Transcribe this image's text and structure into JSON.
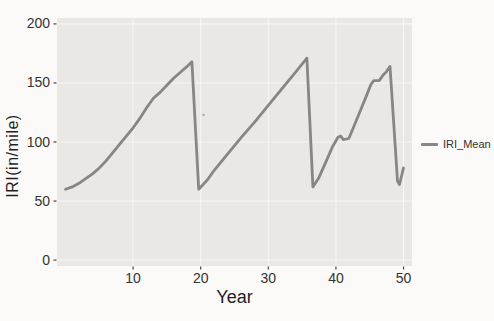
{
  "figure": {
    "kind": "photographed-statistical-plot",
    "background_color": "#fbfaf8",
    "panel_color": "#e9e8e4",
    "tick_text_color": "#333333",
    "axis_title_color": "#1f1f1f"
  },
  "chart_data": {
    "type": "line",
    "title": "",
    "xlabel": "Year",
    "ylabel": "IRI(in/mile)",
    "xlim": [
      0,
      50
    ],
    "ylim": [
      0,
      200
    ],
    "x_ticks": [
      10,
      20,
      30,
      40,
      50
    ],
    "y_ticks": [
      0,
      50,
      100,
      150,
      200
    ],
    "grid": "faint white major gridlines on light gray panel",
    "legend": {
      "position": "right",
      "entries": [
        {
          "label": "IRI_Mean",
          "color": "#868686"
        }
      ]
    },
    "series": [
      {
        "name": "IRI_Mean",
        "color": "#868686",
        "line_width": 2.8,
        "points": [
          [
            0,
            60
          ],
          [
            1,
            62
          ],
          [
            2,
            65
          ],
          [
            3,
            69
          ],
          [
            4,
            73
          ],
          [
            5,
            78
          ],
          [
            6,
            84
          ],
          [
            7,
            91
          ],
          [
            8,
            98
          ],
          [
            9,
            105
          ],
          [
            10,
            112
          ],
          [
            11,
            120
          ],
          [
            12,
            129
          ],
          [
            13,
            137
          ],
          [
            14,
            142
          ],
          [
            15,
            148
          ],
          [
            16,
            154
          ],
          [
            17,
            159
          ],
          [
            18,
            164
          ],
          [
            18.7,
            168
          ],
          [
            19.7,
            60
          ],
          [
            21,
            68
          ],
          [
            22,
            76
          ],
          [
            24,
            90
          ],
          [
            26,
            104
          ],
          [
            28,
            117
          ],
          [
            30,
            131
          ],
          [
            32,
            145
          ],
          [
            34,
            159
          ],
          [
            35.7,
            171
          ],
          [
            36.6,
            62
          ],
          [
            37.5,
            70
          ],
          [
            38.5,
            83
          ],
          [
            39.5,
            96
          ],
          [
            40.3,
            104
          ],
          [
            40.7,
            105
          ],
          [
            41.1,
            102
          ],
          [
            41.9,
            103
          ],
          [
            42.5,
            111
          ],
          [
            43.5,
            125
          ],
          [
            44.5,
            139
          ],
          [
            45.2,
            149
          ],
          [
            45.6,
            152
          ],
          [
            46.4,
            152
          ],
          [
            47,
            157
          ],
          [
            47.4,
            159
          ],
          [
            48,
            164
          ],
          [
            49.1,
            67
          ],
          [
            49.4,
            64
          ],
          [
            50,
            78
          ]
        ]
      }
    ]
  }
}
